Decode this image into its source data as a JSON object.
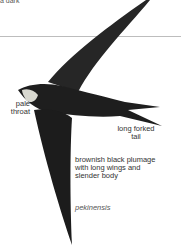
{
  "top_fragment": "a dark",
  "illustration": {
    "subject": "swift-in-flight",
    "colors": {
      "plumage": "#1e1e1e",
      "throat": "#d8d8d0",
      "rule": "#bdbdbd"
    }
  },
  "labels": {
    "throat": "pale throat",
    "tail": "long forked tail",
    "plumage": "brownish black plumage with long wings and slender body",
    "subspecies": "pekinensis"
  }
}
